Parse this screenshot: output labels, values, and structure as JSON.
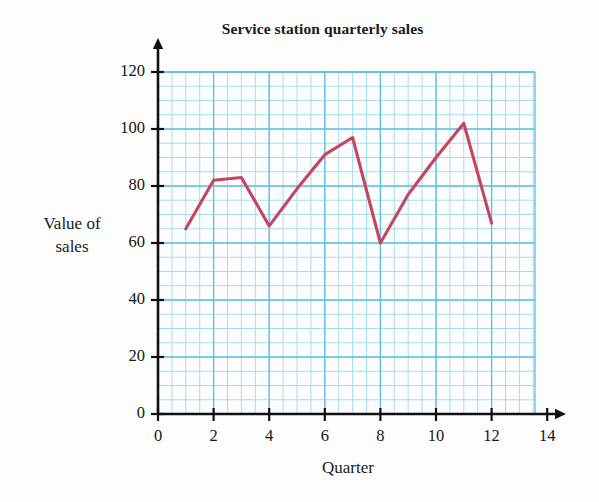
{
  "chart_data": {
    "type": "line",
    "title": "Service station quarterly sales",
    "xlabel": "Quarter",
    "ylabel": "Value of\nsales",
    "x": [
      1,
      2,
      3,
      4,
      5,
      6,
      7,
      8,
      9,
      10,
      11,
      12
    ],
    "values": [
      65,
      82,
      83,
      66,
      79,
      91,
      97,
      60,
      77,
      90,
      102,
      67
    ],
    "series": [
      {
        "name": "Value of sales",
        "values": [
          65,
          82,
          83,
          66,
          79,
          91,
          97,
          60,
          77,
          90,
          102,
          67
        ]
      }
    ],
    "xlim": [
      0,
      14
    ],
    "ylim": [
      0,
      120
    ],
    "x_ticks": [
      0,
      2,
      4,
      6,
      8,
      10,
      12,
      14
    ],
    "x_tick_labels": [
      "0",
      "2",
      "4",
      "6",
      "8",
      "10",
      "12",
      "14"
    ],
    "y_ticks": [
      0,
      20,
      40,
      60,
      80,
      100,
      120
    ],
    "y_tick_labels": [
      "0",
      "20",
      "40",
      "60",
      "80",
      "100",
      "120"
    ],
    "grid": true,
    "grid_minor_step_x": 0.5,
    "grid_minor_step_y": 5,
    "grid_major_step_x": 2,
    "grid_major_step_y": 20,
    "legend": "none",
    "line_color": "#c4455c",
    "grid_color_minor": "#9fd8ef",
    "grid_color_major": "#5fbfe4",
    "axis_color": "#111111",
    "paper_color": "#fdfdfd"
  }
}
